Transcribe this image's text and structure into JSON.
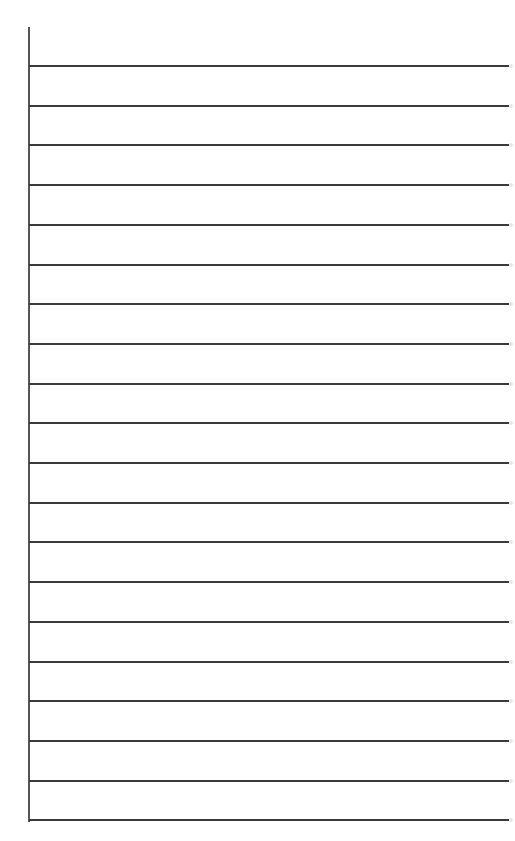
{
  "paper": {
    "type": "lined-paper",
    "line_count": 20,
    "first_line_y": 65,
    "line_spacing": 39.7,
    "line_color": "#3a3a3a",
    "margin_line_color": "#555555",
    "background": "#ffffff"
  }
}
